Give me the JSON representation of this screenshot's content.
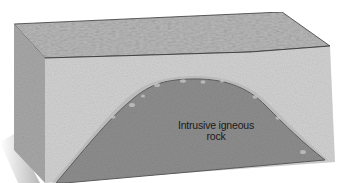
{
  "diagram": {
    "type": "geologic block cross-section",
    "labels": {
      "intrusion_line1": "Intrusive igneous",
      "intrusion_line2": "rock"
    },
    "colors": {
      "top_surface": "#b9b9b9",
      "front_face": "#d2d2d2",
      "side_face": "#a8a8a8",
      "intrusion": "#8e8e8e",
      "intrusion_edge": "#5e5e5e",
      "outline": "#3a3a3a"
    }
  }
}
